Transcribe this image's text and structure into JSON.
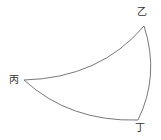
{
  "diagram": {
    "type": "spherical-triangle",
    "vertices": [
      {
        "id": "yi",
        "label": "乙",
        "x": 144,
        "y": 26
      },
      {
        "id": "bing",
        "label": "丙",
        "x": 24,
        "y": 80
      },
      {
        "id": "ding",
        "label": "丁",
        "x": 138,
        "y": 120
      }
    ],
    "stroke_color": "#555555"
  }
}
